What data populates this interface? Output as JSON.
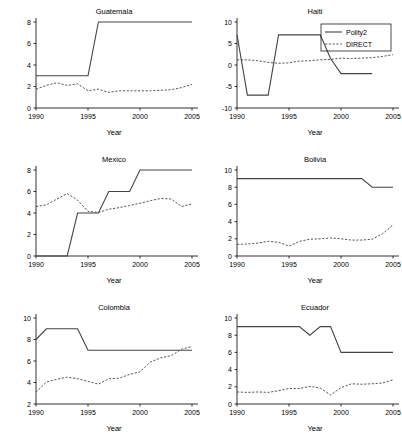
{
  "figure": {
    "xlabel": "Year",
    "legend": {
      "position": "top-right-of-haiti-panel",
      "entries": [
        {
          "label": "Polity2",
          "style": "solid"
        },
        {
          "label": "DIRECT",
          "style": "dashed"
        }
      ]
    }
  },
  "chart_data": [
    {
      "type": "line",
      "title": "Guatemala",
      "xlabel": "Year",
      "ylabel": "",
      "xlim": [
        1990,
        2005
      ],
      "ylim": [
        0,
        8
      ],
      "xticks": [
        1990,
        1995,
        2000,
        2005
      ],
      "yticks": [
        0,
        2,
        4,
        6,
        8
      ],
      "grid": false,
      "x": [
        1990,
        1991,
        1992,
        1993,
        1994,
        1995,
        1996,
        1997,
        1998,
        1999,
        2000,
        2001,
        2002,
        2003,
        2004,
        2005
      ],
      "series": [
        {
          "name": "Polity2",
          "style": "solid",
          "values": [
            3,
            3,
            3,
            3,
            3,
            3,
            8,
            8,
            8,
            8,
            8,
            8,
            8,
            8,
            8,
            8
          ]
        },
        {
          "name": "DIRECT",
          "style": "dashed",
          "values": [
            1.75,
            2.1,
            2.35,
            2.1,
            2.25,
            1.6,
            1.75,
            1.45,
            1.6,
            1.6,
            1.6,
            1.6,
            1.65,
            1.7,
            1.9,
            2.2
          ]
        }
      ]
    },
    {
      "type": "line",
      "title": "Haiti",
      "xlabel": "Year",
      "ylabel": "",
      "xlim": [
        1990,
        2005
      ],
      "ylim": [
        -10,
        10
      ],
      "xticks": [
        1990,
        1995,
        2000,
        2005
      ],
      "yticks": [
        -10,
        -5,
        0,
        5,
        10
      ],
      "grid": false,
      "x": [
        1990,
        1991,
        1992,
        1993,
        1994,
        1995,
        1996,
        1997,
        1998,
        1999,
        2000,
        2001,
        2002,
        2003
      ],
      "series": [
        {
          "name": "Polity2",
          "style": "solid",
          "values": [
            7,
            -7,
            -7,
            -7,
            7,
            7,
            7,
            7,
            7,
            1.5,
            -2,
            -2,
            -2,
            -2
          ]
        },
        {
          "name": "DIRECT",
          "style": "dashed",
          "values": [
            1.2,
            1.2,
            1.0,
            0.6,
            0.4,
            0.5,
            0.9,
            1.0,
            1.2,
            1.3,
            1.6,
            1.5,
            1.6,
            1.7,
            2.0,
            2.4
          ]
        }
      ],
      "direct_x": [
        1990,
        1991,
        1992,
        1993,
        1994,
        1995,
        1996,
        1997,
        1998,
        1999,
        2000,
        2001,
        2002,
        2003,
        2004,
        2005
      ]
    },
    {
      "type": "line",
      "title": "Mexico",
      "xlabel": "Year",
      "ylabel": "",
      "xlim": [
        1990,
        2005
      ],
      "ylim": [
        0,
        8
      ],
      "xticks": [
        1990,
        1995,
        2000,
        2005
      ],
      "yticks": [
        0,
        2,
        4,
        6,
        8
      ],
      "grid": false,
      "x": [
        1990,
        1991,
        1992,
        1993,
        1994,
        1995,
        1996,
        1997,
        1998,
        1999,
        2000,
        2001,
        2002,
        2003,
        2004,
        2005
      ],
      "series": [
        {
          "name": "Polity2",
          "style": "solid",
          "values": [
            0,
            0,
            0,
            0,
            4,
            4,
            4,
            6,
            6,
            6,
            8,
            8,
            8,
            8,
            8,
            8
          ]
        },
        {
          "name": "DIRECT",
          "style": "dashed",
          "values": [
            4.6,
            4.75,
            5.3,
            5.8,
            5.2,
            4.15,
            4.05,
            4.35,
            4.5,
            4.7,
            4.9,
            5.15,
            5.35,
            5.3,
            4.6,
            4.85
          ]
        }
      ]
    },
    {
      "type": "line",
      "title": "Bolivia",
      "xlabel": "Year",
      "ylabel": "",
      "xlim": [
        1990,
        2005
      ],
      "ylim": [
        0,
        10
      ],
      "xticks": [
        1990,
        1995,
        2000,
        2005
      ],
      "yticks": [
        0,
        2,
        4,
        6,
        8,
        10
      ],
      "grid": false,
      "x": [
        1990,
        1991,
        1992,
        1993,
        1994,
        1995,
        1996,
        1997,
        1998,
        1999,
        2000,
        2001,
        2002,
        2003,
        2004,
        2005
      ],
      "series": [
        {
          "name": "Polity2",
          "style": "solid",
          "values": [
            9,
            9,
            9,
            9,
            9,
            9,
            9,
            9,
            9,
            9,
            9,
            9,
            9,
            8,
            8,
            8
          ]
        },
        {
          "name": "DIRECT",
          "style": "dashed",
          "values": [
            1.35,
            1.4,
            1.5,
            1.7,
            1.6,
            1.15,
            1.7,
            1.95,
            2.0,
            2.1,
            2.0,
            1.85,
            1.85,
            1.95,
            2.6,
            3.6
          ]
        }
      ]
    },
    {
      "type": "line",
      "title": "Colombia",
      "xlabel": "Year",
      "ylabel": "",
      "xlim": [
        1990,
        2005
      ],
      "ylim": [
        2,
        10
      ],
      "xticks": [
        1990,
        1995,
        2000,
        2005
      ],
      "yticks": [
        2,
        4,
        6,
        8,
        10
      ],
      "grid": false,
      "x": [
        1990,
        1991,
        1992,
        1993,
        1994,
        1995,
        1996,
        1997,
        1998,
        1999,
        2000,
        2001,
        2002,
        2003,
        2004,
        2005
      ],
      "series": [
        {
          "name": "Polity2",
          "style": "solid",
          "values": [
            8,
            9,
            9,
            9,
            9,
            7,
            7,
            7,
            7,
            7,
            7,
            7,
            7,
            7,
            7,
            7
          ]
        },
        {
          "name": "DIRECT",
          "style": "dashed",
          "values": [
            3.1,
            4.05,
            4.3,
            4.5,
            4.35,
            4.1,
            3.85,
            4.35,
            4.4,
            4.75,
            5.0,
            5.9,
            6.3,
            6.5,
            7.1,
            7.35
          ]
        }
      ]
    },
    {
      "type": "line",
      "title": "Ecuador",
      "xlabel": "Year",
      "ylabel": "",
      "xlim": [
        1990,
        2005
      ],
      "ylim": [
        0,
        10
      ],
      "xticks": [
        1990,
        1995,
        2000,
        2005
      ],
      "yticks": [
        0,
        2,
        4,
        6,
        8,
        10
      ],
      "grid": false,
      "x": [
        1990,
        1991,
        1992,
        1993,
        1994,
        1995,
        1996,
        1997,
        1998,
        1999,
        2000,
        2001,
        2002,
        2003,
        2004,
        2005
      ],
      "series": [
        {
          "name": "Polity2",
          "style": "solid",
          "values": [
            9,
            9,
            9,
            9,
            9,
            9,
            9,
            8,
            9,
            9,
            6,
            6,
            6,
            6,
            6,
            6
          ]
        },
        {
          "name": "DIRECT",
          "style": "dashed",
          "values": [
            1.4,
            1.35,
            1.4,
            1.35,
            1.55,
            1.8,
            1.8,
            2.05,
            1.85,
            1.05,
            1.9,
            2.35,
            2.3,
            2.35,
            2.45,
            2.8
          ]
        }
      ]
    }
  ]
}
